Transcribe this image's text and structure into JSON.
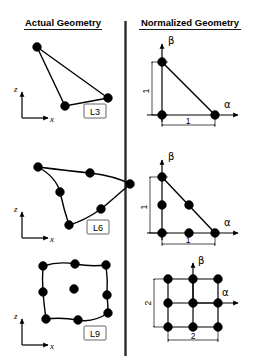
{
  "headers": {
    "left": "Actual Geometry",
    "right": "Normalized Geometry"
  },
  "axis_labels": {
    "x": "x",
    "z": "z",
    "alpha": "α",
    "beta": "β"
  },
  "elements": [
    {
      "id": "L3",
      "label": "L3",
      "node_count": 3,
      "actual": {
        "description": "straight-sided triangle",
        "nodes": [
          [
            37,
            47
          ],
          [
            65,
            106
          ],
          [
            108,
            98
          ]
        ]
      },
      "normalized": {
        "description": "unit right triangle",
        "nodes": [
          [
            162,
            62
          ],
          [
            162,
            115
          ],
          [
            215,
            115
          ]
        ],
        "dim_x": "1",
        "dim_y": "1"
      }
    },
    {
      "id": "L6",
      "label": "L6",
      "node_count": 6,
      "actual": {
        "description": "curved-sided quadratic triangle",
        "nodes": [
          [
            38,
            167
          ],
          [
            60,
            192
          ],
          [
            69,
            225
          ],
          [
            101,
            209
          ],
          [
            130,
            184
          ],
          [
            90,
            173
          ]
        ]
      },
      "normalized": {
        "description": "unit right triangle with midside nodes",
        "nodes": [
          [
            162,
            177
          ],
          [
            162,
            205
          ],
          [
            162,
            233
          ],
          [
            189,
            233
          ],
          [
            215,
            233
          ],
          [
            189,
            205
          ]
        ],
        "dim_x": "1",
        "dim_y": "1"
      }
    },
    {
      "id": "L9",
      "label": "L9",
      "node_count": 9,
      "actual": {
        "description": "curved-sided nine-node quadrilateral with center node",
        "nodes": [
          [
            43,
            266
          ],
          [
            75,
            264
          ],
          [
            106,
            265
          ],
          [
            43,
            292
          ],
          [
            74,
            289
          ],
          [
            107,
            295
          ],
          [
            46,
            319
          ],
          [
            78,
            320
          ],
          [
            108,
            313
          ]
        ]
      },
      "normalized": {
        "description": "two-by-two square grid centered at origin",
        "nodes": [
          [
            168,
            279
          ],
          [
            193,
            279
          ],
          [
            218,
            279
          ],
          [
            168,
            303
          ],
          [
            193,
            303
          ],
          [
            218,
            303
          ],
          [
            168,
            327
          ],
          [
            193,
            327
          ],
          [
            218,
            327
          ]
        ],
        "dim_x": "2",
        "dim_y": "2"
      }
    }
  ]
}
